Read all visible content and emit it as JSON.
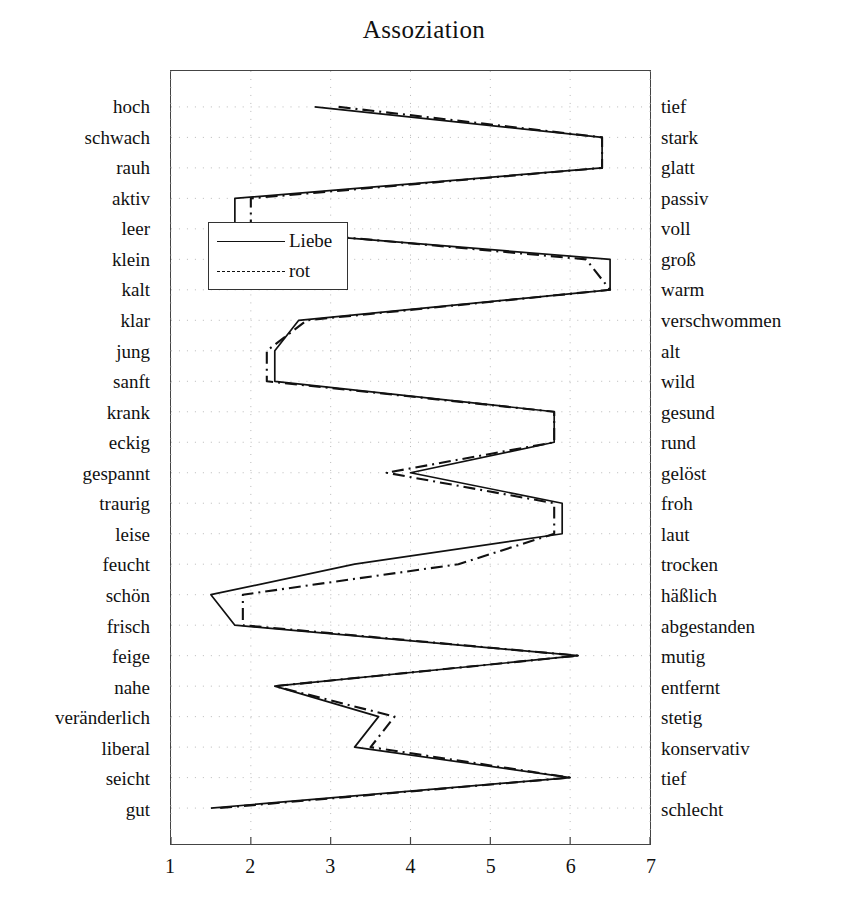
{
  "chart_data": {
    "type": "line",
    "title": "Assoziation",
    "xlabel": "",
    "ylabel": "",
    "xlim": [
      1,
      7
    ],
    "xticks": [
      1,
      2,
      3,
      4,
      5,
      6,
      7
    ],
    "xtick_labels": [
      "1",
      "2",
      "3",
      "4",
      "5",
      "6",
      "7"
    ],
    "grid": true,
    "legend_position": "upper-left-inside",
    "orientation": "horizontal-semantic-differential",
    "left_labels": [
      "hoch",
      "schwach",
      "rauh",
      "aktiv",
      "leer",
      "klein",
      "kalt",
      "klar",
      "jung",
      "sanft",
      "krank",
      "eckig",
      "gespannt",
      "traurig",
      "leise",
      "feucht",
      "schön",
      "frisch",
      "feige",
      "nahe",
      "veränderlich",
      "liberal",
      "seicht",
      "gut"
    ],
    "right_labels": [
      "tief",
      "stark",
      "glatt",
      "passiv",
      "voll",
      "groß",
      "warm",
      "verschwommen",
      "alt",
      "wild",
      "gesund",
      "rund",
      "gelöst",
      "froh",
      "laut",
      "trocken",
      "häßlich",
      "abgestanden",
      "mutig",
      "entfernt",
      "stetig",
      "konservativ",
      "tief",
      "schlecht"
    ],
    "categories": [
      "hoch-tief",
      "schwach-stark",
      "rauh-glatt",
      "aktiv-passiv",
      "leer-voll",
      "klein-groß",
      "kalt-warm",
      "klar-verschwommen",
      "jung-alt",
      "sanft-wild",
      "krank-gesund",
      "eckig-rund",
      "gespannt-gelöst",
      "traurig-froh",
      "leise-laut",
      "feucht-trocken",
      "schön-häßlich",
      "frisch-abgestanden",
      "feige-mutig",
      "nahe-entfernt",
      "veränderlich-stetig",
      "liberal-konservativ",
      "seicht-tief",
      "gut-schlecht"
    ],
    "series": [
      {
        "name": "Liebe",
        "style": "solid",
        "color": "#111111",
        "values": [
          2.8,
          6.4,
          6.4,
          1.8,
          1.8,
          6.5,
          6.5,
          2.6,
          2.3,
          2.3,
          5.8,
          5.8,
          4.0,
          5.9,
          5.9,
          3.3,
          1.5,
          1.8,
          6.1,
          2.3,
          3.6,
          3.3,
          6.0,
          1.5
        ]
      },
      {
        "name": "rot",
        "style": "dashdot",
        "color": "#111111",
        "values": [
          3.1,
          6.4,
          6.4,
          2.0,
          2.0,
          6.2,
          6.5,
          2.7,
          2.2,
          2.2,
          5.8,
          5.8,
          3.7,
          5.8,
          5.8,
          4.6,
          1.9,
          1.9,
          6.1,
          2.3,
          3.8,
          3.5,
          6.0,
          1.6
        ]
      }
    ]
  },
  "legend": {
    "items": [
      {
        "label": "Liebe",
        "style": "solid"
      },
      {
        "label": "rot",
        "style": "dashdot"
      }
    ]
  }
}
